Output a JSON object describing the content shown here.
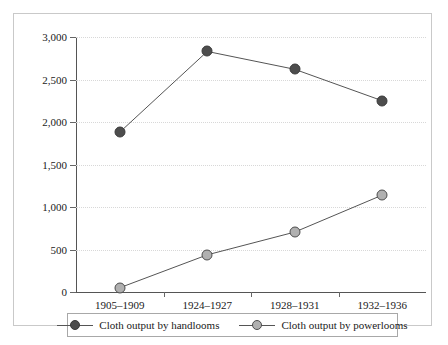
{
  "chart_data": {
    "type": "line",
    "title": "",
    "xlabel": "",
    "ylabel": "",
    "ylim": [
      0,
      3000
    ],
    "grid": true,
    "legend_position": "bottom",
    "categories": [
      "1905–1909",
      "1924–1927",
      "1928–1931",
      "1932–1936"
    ],
    "yticks": [
      "0",
      "500",
      "1,000",
      "1,500",
      "2,000",
      "2,500",
      "3,000"
    ],
    "ytick_values": [
      0,
      500,
      1000,
      1500,
      2000,
      2500,
      3000
    ],
    "series": [
      {
        "name": "Cloth output by handlooms",
        "values": [
          1880,
          2830,
          2620,
          2250
        ],
        "color": "#4d4d4d",
        "marker": "filled-circle"
      },
      {
        "name": "Cloth output by powerlooms",
        "values": [
          50,
          437,
          705,
          1140
        ],
        "color": "#b0b0b0",
        "marker": "open-circle"
      }
    ]
  },
  "legend": {
    "items": [
      {
        "label": "Cloth output by handlooms"
      },
      {
        "label": "Cloth output by powerlooms"
      }
    ]
  }
}
